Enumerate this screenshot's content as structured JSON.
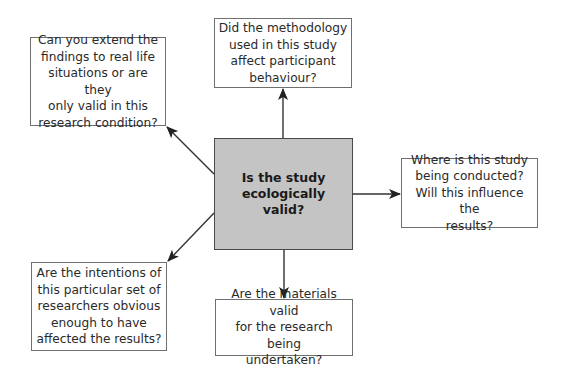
{
  "diagram": {
    "center": {
      "lines": [
        "Is the study",
        "ecologically",
        "valid?"
      ],
      "fill": "#c4c4c4"
    },
    "nodes": [
      {
        "id": "top-left",
        "lines": [
          "Can you extend the",
          "findings to real life",
          "situations or are they",
          "only valid in this",
          "research condition?"
        ]
      },
      {
        "id": "top",
        "lines": [
          "Did the methodology",
          "used in this study",
          "affect participant",
          "behaviour?"
        ]
      },
      {
        "id": "right",
        "lines": [
          "Where is this study",
          "being conducted?",
          "Will this influence the",
          "results?"
        ]
      },
      {
        "id": "bottom-left",
        "lines": [
          "Are the intentions of",
          "this particular set of",
          "researchers obvious",
          "enough to have",
          "affected the results?"
        ]
      },
      {
        "id": "bottom",
        "lines": [
          "Are the materials valid",
          "for the research being",
          "undertaken?"
        ]
      }
    ],
    "edges": [
      {
        "from": "center",
        "to": "top-left"
      },
      {
        "from": "center",
        "to": "top"
      },
      {
        "from": "center",
        "to": "right"
      },
      {
        "from": "center",
        "to": "bottom-left"
      },
      {
        "from": "center",
        "to": "bottom"
      }
    ]
  }
}
